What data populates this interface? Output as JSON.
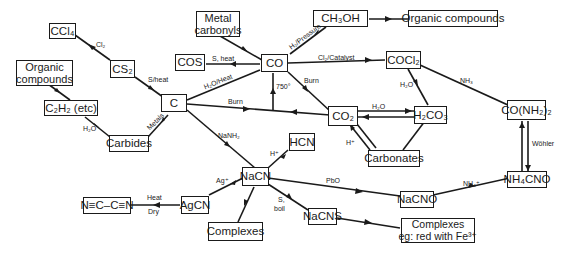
{
  "nodes": {
    "ccl4": "CCl₄",
    "metal_carbonyls": "Metal carbonyls",
    "ch3oh": "CH₃OH",
    "organic_top": "Organic compounds",
    "cs2": "CS₂",
    "organic_left": "Organic compounds",
    "cos": "COS",
    "co": "CO",
    "cocl2": "COCl₂",
    "c2h2": "C₂H₂ (etc)",
    "c": "C",
    "co2": "CO₂",
    "h2co3": "H₂CO₃",
    "urea": "CO(NH₂)₂",
    "carbides": "Carbides",
    "hcn": "HCN",
    "carbonates": "Carbonates",
    "nacn": "NaCN",
    "nacno": "NaCNO",
    "nh4cno": "NH₄CNO",
    "cyanogen": "N≡C–C≡N",
    "agcn": "AgCN",
    "nacns": "NaCNS",
    "complexes": "Complexes",
    "complexes_fe_1": "Complexes",
    "complexes_fe_2": "eg: red with Fe³⁺"
  },
  "edge_labels": {
    "cl2": "Cl₂",
    "s_heat_cs2": "S/heat",
    "h2o_carbides": "H₂O",
    "metals": "Metals",
    "s_heat_cos": "S, heat",
    "h2_pressure": "H₂/Pressure",
    "cl2_catalyst": "Cl₂/Catalyst",
    "h2o_heat": "H₂O/Heat",
    "t750": "750°",
    "burn_co": "Burn",
    "burn_c": "Burn",
    "h2o_co2": "H₂O",
    "h2o_cocl2": "H₂O",
    "nh3": "NH₃",
    "h_plus_carbonates": "H⁺",
    "wohler": "Wöhler",
    "nanh2": "NaNH₂",
    "h_plus_hcn": "H⁺",
    "ag_plus": "Ag⁺",
    "pbo": "PbO",
    "nh4_plus": "NH₄⁺",
    "heat": "Heat",
    "dry": "Dry",
    "s_boil_1": "S,",
    "s_boil_2": "boil"
  }
}
